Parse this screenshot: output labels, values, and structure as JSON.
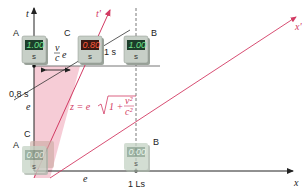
{
  "axes": {
    "t_label": "t",
    "t_prime_label": "t'",
    "x_label": "x",
    "x_prime_label": "x'"
  },
  "labels": {
    "point_a_top": "A",
    "point_b_top": "B",
    "point_c_top": "C",
    "point_a_bottom": "A",
    "point_b_bottom": "B",
    "point_c_bottom": "C",
    "time_08s": "0,8 s",
    "time_1s": "1 s",
    "distance_1ls": "1 Ls",
    "e_vertical": "e",
    "e_horizontal": "e",
    "ve_over_c": "v/c · e",
    "formula_lhs": "z = e",
    "formula_radicand": "1 + v²/c²"
  },
  "clocks": {
    "top_a": {
      "value": "1.00",
      "unit": "s",
      "color": "#6fe08a"
    },
    "top_c": {
      "value": "0.80",
      "unit": "s",
      "color": "#ff5a3a"
    },
    "top_b": {
      "value": "1.00",
      "unit": "s",
      "color": "#6fe08a"
    },
    "bottom_a": {
      "value": "0.00",
      "unit": "s",
      "color": "#cfe8d6"
    },
    "bottom_b": {
      "value": "0.00",
      "unit": "s",
      "color": "#cfe8d6"
    }
  },
  "colors": {
    "accent_red": "#d23a63",
    "shade_pink": "#f4c3cf",
    "axis": "#222222",
    "clock_body": "#b9c2b9"
  }
}
